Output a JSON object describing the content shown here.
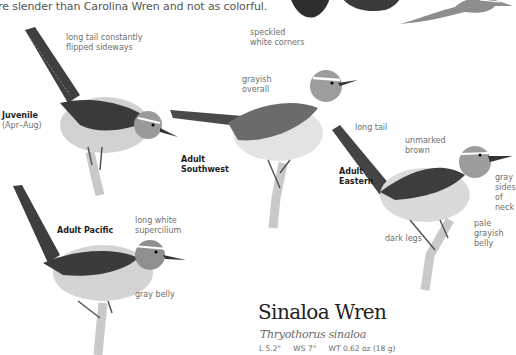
{
  "intro_text": "re slender than Carolina Wren and not as colorful.",
  "plates": {
    "juvenile": {
      "label": "Juvenile",
      "sublabel": "(Apr–Aug)",
      "notes": [
        "long tail constantly",
        "flipped sideways"
      ]
    },
    "southwest": {
      "label_lines": [
        "Adult",
        "Southwest"
      ],
      "notes_speckled": [
        "speckled",
        "white corners"
      ],
      "notes_grayish": [
        "grayish",
        "overall"
      ]
    },
    "eastern": {
      "label_lines": [
        "Adult",
        "Eastern"
      ],
      "note_long_tail": "long tail",
      "note_unmarked": [
        "unmarked",
        "brown"
      ],
      "note_gray_sides": [
        "gray",
        "sides",
        "of",
        "neck"
      ],
      "note_pale_belly": [
        "pale",
        "grayish",
        "belly"
      ],
      "note_dark_legs": "dark legs"
    },
    "pacific": {
      "label": "Adult Pacific",
      "note_supercilium": [
        "long white",
        "supercilium"
      ],
      "note_gray_belly": "gray belly"
    }
  },
  "species": {
    "common_name": "Sinaloa Wren",
    "scientific_name": "Thryothorus sinaloa",
    "measurements": {
      "length": "L 5.2\"",
      "wingspan": "WS 7\"",
      "weight": "WT 0.62 oz (18 g)"
    }
  },
  "colors": {
    "bird_dark": "#3a3a3a",
    "bird_mid": "#7d7d7d",
    "bird_light": "#d8d8d8",
    "branch": "#c9c9c9"
  }
}
